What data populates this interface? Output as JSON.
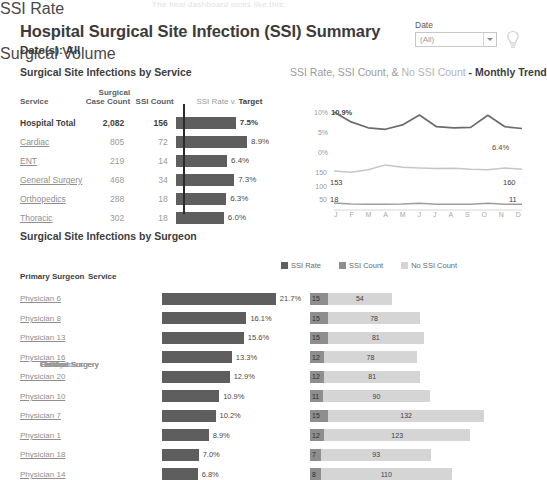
{
  "ghost_text": "The final dashboard looks like this:",
  "header": {
    "title": "Hospital Surgical Site Infection (SSI) Summary",
    "subtitle": "Date(s): All"
  },
  "filter": {
    "label": "Date",
    "value": "(All)",
    "caret_icon": "chevron-down-icon",
    "bulb_icon": "lightbulb-icon"
  },
  "sections": {
    "service_title": "Surgical Site Infections by Service",
    "trend_title_a": "SSI Rate, SSI Count, &",
    "trend_title_b": "No SSI Count",
    "trend_title_c": "- Monthly Trend",
    "surgeon_title": "Surgical Site Infections by Surgeon"
  },
  "service_table": {
    "headers": {
      "service": "Service",
      "case_count": "Surgical\nCase Count",
      "ssi_count": "SSI Count",
      "chart_a": "SSI Rate v. ",
      "chart_b": "Target"
    },
    "rows": [
      {
        "service": "Hospital Total",
        "case_count": "2,082",
        "ssi_count": "156",
        "rate": "7.5%",
        "rate_value": 7.5,
        "total": true
      },
      {
        "service": "Cardiac",
        "case_count": "805",
        "ssi_count": "72",
        "rate": "8.9%",
        "rate_value": 8.9,
        "total": false
      },
      {
        "service": "ENT",
        "case_count": "219",
        "ssi_count": "14",
        "rate": "6.4%",
        "rate_value": 6.4,
        "total": false
      },
      {
        "service": "General Surgery",
        "case_count": "468",
        "ssi_count": "34",
        "rate": "7.3%",
        "rate_value": 7.3,
        "total": false
      },
      {
        "service": "Orthopedics",
        "case_count": "288",
        "ssi_count": "18",
        "rate": "6.3%",
        "rate_value": 6.3,
        "total": false
      },
      {
        "service": "Thoracic",
        "case_count": "302",
        "ssi_count": "18",
        "rate": "6.0%",
        "rate_value": 6.0,
        "total": false
      }
    ]
  },
  "trend": {
    "axis_rate": "SSI Rate",
    "axis_volume": "Surgical Volume",
    "rate_ticks": [
      "10%",
      "5%",
      "0%"
    ],
    "volume_ticks": [
      "150",
      "100",
      "50"
    ],
    "label_rate_start": "10.9%",
    "label_rate_end": "6.4%",
    "label_vol_start": "153",
    "label_vol_end": "160",
    "label_ssi_start": "18",
    "label_ssi_end": "11",
    "months": [
      "J",
      "F",
      "M",
      "A",
      "M",
      "J",
      "J",
      "A",
      "S",
      "O",
      "N",
      "D"
    ]
  },
  "legend": [
    {
      "label": "SSI Rate",
      "color": "#5e5e5e"
    },
    {
      "label": "SSI Count",
      "color": "#8e8e8e"
    },
    {
      "label": "No SSI Count",
      "color": "#d5d5d5"
    }
  ],
  "surgeon_table": {
    "headers": {
      "surgeon": "Primary Surgeon",
      "service": "Service"
    },
    "rows": [
      {
        "surgeon": "Physician 6",
        "service": "Cardiac",
        "rate": "21.7%",
        "rate_value": 21.7,
        "ssi": "15",
        "no_ssi": "54"
      },
      {
        "surgeon": "Physician 8",
        "service": "Cardiac",
        "rate": "16.1%",
        "rate_value": 16.1,
        "ssi": "15",
        "no_ssi": "78"
      },
      {
        "surgeon": "Physician 13",
        "service": "General Surgery",
        "rate": "15.6%",
        "rate_value": 15.6,
        "ssi": "15",
        "no_ssi": "81"
      },
      {
        "surgeon": "Physician 16",
        "service": "Orthopedics",
        "rate": "13.3%",
        "rate_value": 13.3,
        "ssi": "12",
        "no_ssi": "78"
      },
      {
        "surgeon": "Physician 20",
        "service": "Thoracic",
        "rate": "12.9%",
        "rate_value": 12.9,
        "ssi": "12",
        "no_ssi": "81"
      },
      {
        "surgeon": "Physician 10",
        "service": "General Surgery",
        "rate": "10.9%",
        "rate_value": 10.9,
        "ssi": "11",
        "no_ssi": "90"
      },
      {
        "surgeon": "Physician 7",
        "service": "Cardiac",
        "rate": "10.2%",
        "rate_value": 10.2,
        "ssi": "15",
        "no_ssi": "132"
      },
      {
        "surgeon": "Physician 1",
        "service": "Cardiac",
        "rate": "8.9%",
        "rate_value": 8.9,
        "ssi": "12",
        "no_ssi": "123"
      },
      {
        "surgeon": "Physician 18",
        "service": "ENT",
        "rate": "7.0%",
        "rate_value": 7.0,
        "ssi": "7",
        "no_ssi": "93"
      },
      {
        "surgeon": "Physician 14",
        "service": "General Surgery",
        "rate": "6.8%",
        "rate_value": 6.8,
        "ssi": "8",
        "no_ssi": "110"
      }
    ]
  },
  "chart_data": [
    {
      "type": "bar",
      "title": "SSI Rate v. Target",
      "categories": [
        "Hospital Total",
        "Cardiac",
        "ENT",
        "General Surgery",
        "Orthopedics",
        "Thoracic"
      ],
      "values": [
        7.5,
        8.9,
        6.4,
        7.3,
        6.3,
        6.0
      ],
      "target": 2.0,
      "xlabel": "SSI Rate",
      "ylabel": "",
      "xlim": [
        0,
        10
      ],
      "grid": false
    },
    {
      "type": "line",
      "title": "SSI Rate, SSI Count, & No SSI Count - Monthly Trend",
      "x": [
        "J",
        "F",
        "M",
        "A",
        "M",
        "J",
        "J",
        "A",
        "S",
        "O",
        "N",
        "D"
      ],
      "series": [
        {
          "name": "SSI Rate",
          "values": [
            10.9,
            8.2,
            6.6,
            6.2,
            7.4,
            10.1,
            6.9,
            6.6,
            6.7,
            10.0,
            6.9,
            6.4
          ],
          "ylabel": "SSI Rate",
          "ylim": [
            0,
            12
          ]
        },
        {
          "name": "Surgical Volume",
          "values": [
            153,
            148,
            158,
            178,
            168,
            165,
            163,
            164,
            160,
            158,
            165,
            160
          ],
          "ylabel": "Surgical Volume",
          "ylim": [
            50,
            190
          ]
        },
        {
          "name": "SSI Count",
          "values": [
            18,
            12,
            11,
            11,
            12,
            17,
            11,
            11,
            11,
            16,
            11,
            11
          ],
          "ylabel": "Surgical Volume",
          "ylim": [
            50,
            190
          ]
        }
      ],
      "ylim": [
        0,
        12
      ],
      "grid": false,
      "legend": "top"
    },
    {
      "type": "bar",
      "title": "Surgical Site Infections by Surgeon",
      "categories": [
        "Physician 6",
        "Physician 8",
        "Physician 13",
        "Physician 16",
        "Physician 20",
        "Physician 10",
        "Physician 7",
        "Physician 1",
        "Physician 18",
        "Physician 14"
      ],
      "series": [
        {
          "name": "SSI Rate",
          "values": [
            21.7,
            16.1,
            15.6,
            13.3,
            12.9,
            10.9,
            10.2,
            8.9,
            7.0,
            6.8
          ]
        },
        {
          "name": "SSI Count",
          "values": [
            15,
            15,
            15,
            12,
            12,
            11,
            15,
            12,
            7,
            8
          ]
        },
        {
          "name": "No SSI Count",
          "values": [
            54,
            78,
            81,
            78,
            81,
            90,
            132,
            123,
            93,
            110
          ]
        }
      ],
      "xlabel": "",
      "ylabel": "",
      "grid": false,
      "legend": "top"
    }
  ]
}
